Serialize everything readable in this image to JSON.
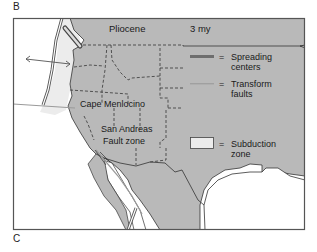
{
  "panel_labels": {
    "top": "B",
    "bottom": "C"
  },
  "map": {
    "epoch": "Pliocene",
    "age": "3 my",
    "place_labels": {
      "cape": "Cape Menlocino",
      "fault_line1": "San Andreas",
      "fault_line2": "Fault zone"
    },
    "colors": {
      "land": "#b9b9b9",
      "ocean": "#ffffff",
      "subduction_zone": "#ececec",
      "spreading_center": "#6e6e6e",
      "transform_fault": "#a0a0a0",
      "frame": "#555555"
    }
  },
  "legend": {
    "items": [
      {
        "symbol": "spreading-center-line",
        "equals": "=",
        "line1": "Spreading",
        "line2": "centers"
      },
      {
        "symbol": "transform-fault-line",
        "equals": "=",
        "line1": "Transform",
        "line2": "faults"
      },
      {
        "symbol": "subduction-zone-box",
        "equals": "=",
        "line1": "Subduction",
        "line2": "zone"
      }
    ]
  }
}
